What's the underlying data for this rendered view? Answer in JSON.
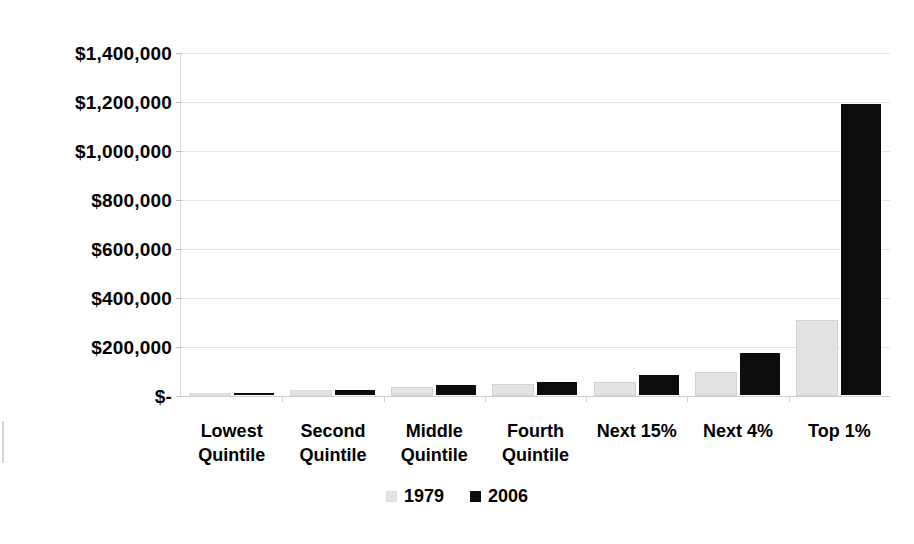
{
  "chart_data": {
    "type": "bar",
    "title": "",
    "subtitle": "",
    "xlabel": "",
    "ylabel": "",
    "ylim": [
      0,
      1400000
    ],
    "grid": true,
    "legend_position": "bottom",
    "categories": [
      "Lowest Quintile",
      "Second Quintile",
      "Middle Quintile",
      "Fourth Quintile",
      "Next 15%",
      "Next 4%",
      "Top 1%"
    ],
    "category_lines": [
      [
        "Lowest",
        "Quintile"
      ],
      [
        "Second",
        "Quintile"
      ],
      [
        "Middle",
        "Quintile"
      ],
      [
        "Fourth",
        "Quintile"
      ],
      [
        "Next 15%",
        ""
      ],
      [
        "Next 4%",
        ""
      ],
      [
        "Top 1%",
        ""
      ]
    ],
    "series": [
      {
        "name": "1979",
        "color": "#e3e3e3",
        "values": [
          11000,
          23000,
          38000,
          48000,
          57000,
          98000,
          310000
        ]
      },
      {
        "name": "2006",
        "color": "#0d0d0d",
        "values": [
          16000,
          30000,
          48000,
          62000,
          90000,
          180000,
          1195000
        ]
      }
    ],
    "y_ticks": [
      0,
      200000,
      400000,
      600000,
      800000,
      1000000,
      1200000,
      1400000
    ],
    "y_tick_labels": [
      "$-",
      "$200,000",
      "$400,000",
      "$600,000",
      "$800,000",
      "$1,000,000",
      "$1,200,000",
      "$1,400,000"
    ]
  },
  "legend": {
    "items": [
      {
        "label": "1979",
        "swatch": "legend-swatch-1979"
      },
      {
        "label": "2006",
        "swatch": "legend-swatch-2006"
      }
    ]
  }
}
